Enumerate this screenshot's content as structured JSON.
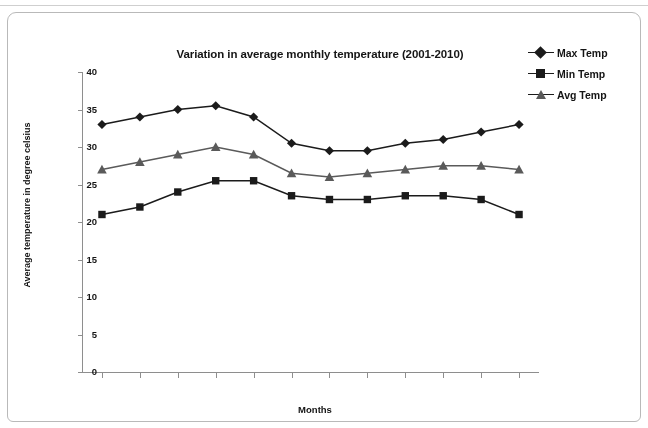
{
  "chart_data": {
    "type": "line",
    "title": "Variation in average monthly temperature (2001-2010)",
    "xlabel": "Months",
    "ylabel": "Average temperature in degree celsius",
    "categories": [
      "Jan",
      "Feb",
      "Mar",
      "Apr",
      "May",
      "Jun",
      "Jul",
      "Aug",
      "Sep",
      "Oct",
      "Nov",
      "Dec"
    ],
    "series": [
      {
        "name": "Max Temp",
        "marker": "diamond",
        "color": "#1b1b1b",
        "values": [
          33,
          34,
          35,
          35.5,
          34,
          30.5,
          29.5,
          29.5,
          30.5,
          31,
          32,
          33
        ]
      },
      {
        "name": "Min Temp",
        "marker": "square",
        "color": "#1b1b1b",
        "values": [
          21,
          22,
          24,
          25.5,
          25.5,
          23.5,
          23,
          23,
          23.5,
          23.5,
          23,
          21
        ]
      },
      {
        "name": "Avg Temp",
        "marker": "triangle",
        "color": "#5a5a5a",
        "values": [
          27,
          28,
          29,
          30,
          29,
          26.5,
          26,
          26.5,
          27,
          27.5,
          27.5,
          27
        ]
      }
    ],
    "ylim": [
      0,
      40
    ],
    "yticks": [
      0,
      5,
      10,
      15,
      20,
      25,
      30,
      35,
      40
    ],
    "grid": false,
    "legend_position": "top-right"
  }
}
